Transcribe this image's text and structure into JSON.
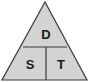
{
  "diagram": {
    "type": "formula-triangle",
    "top_label": "D",
    "bottom_left_label": "S",
    "bottom_right_label": "T",
    "fill_color": "#d3d3d3",
    "stroke_color": "#3a3a3a"
  }
}
